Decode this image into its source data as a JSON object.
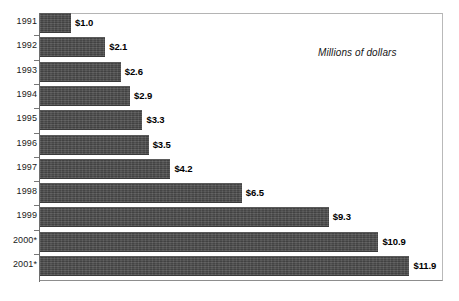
{
  "chart_data": {
    "type": "bar",
    "orientation": "horizontal",
    "title": "",
    "subtitle": "",
    "xlabel": "",
    "ylabel": "",
    "annotation": "Millions of dollars",
    "grid": false,
    "legend": null,
    "xlim": [
      0,
      12.9
    ],
    "categories": [
      "1991",
      "1992",
      "1993",
      "1994",
      "1995",
      "1996",
      "1997",
      "1998",
      "1999",
      "2000*",
      "2001*"
    ],
    "values": [
      1.0,
      2.1,
      2.6,
      2.9,
      3.3,
      3.5,
      4.2,
      6.5,
      9.3,
      10.9,
      11.9
    ],
    "data_labels": [
      "$1.0",
      "$2.1",
      "$2.6",
      "$2.9",
      "$3.3",
      "$3.5",
      "$4.2",
      "$6.5",
      "$9.3",
      "$10.9",
      "$11.9"
    ],
    "bars": [
      {
        "category": "1991",
        "value": 1.0,
        "label": "$1.0"
      },
      {
        "category": "1992",
        "value": 2.1,
        "label": "$2.1"
      },
      {
        "category": "1993",
        "value": 2.6,
        "label": "$2.6"
      },
      {
        "category": "1994",
        "value": 2.9,
        "label": "$2.9"
      },
      {
        "category": "1995",
        "value": 3.3,
        "label": "$3.3"
      },
      {
        "category": "1996",
        "value": 3.5,
        "label": "$3.5"
      },
      {
        "category": "1997",
        "value": 4.2,
        "label": "$4.2"
      },
      {
        "category": "1998",
        "value": 6.5,
        "label": "$6.5"
      },
      {
        "category": "1999",
        "value": 9.3,
        "label": "$9.3"
      },
      {
        "category": "2000*",
        "value": 10.9,
        "label": "$10.9"
      },
      {
        "category": "2001*",
        "value": 11.9,
        "label": "$11.9"
      }
    ],
    "colors": {
      "bar_fill": "#4d4d4d",
      "label_text": "#000000",
      "axis": "#6e6e6e",
      "frame": "#b4b4b4",
      "background": "#ffffff"
    }
  }
}
